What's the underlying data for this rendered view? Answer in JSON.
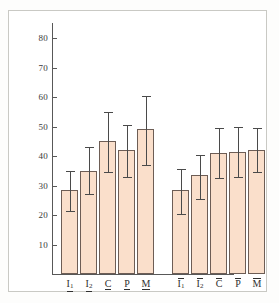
{
  "chart_data": {
    "type": "bar",
    "title": "",
    "subtitle": "",
    "xlabel": "",
    "ylabel": "",
    "ylim": [
      0,
      80
    ],
    "yticks": [
      10,
      20,
      30,
      40,
      50,
      60,
      70,
      80
    ],
    "grid": false,
    "legend": "none",
    "error_bars": "vertical, capped, symmetric-ish",
    "bar_color": "#fadfcb",
    "bar_edge_color": "#6d5d55",
    "error_bar_color": "#4a4a4a",
    "axis_color": "#585858",
    "frame_color": "#c9c9c4",
    "categories": [
      "I1",
      "I2",
      "C",
      "P",
      "M",
      "I1bar",
      "I2bar",
      "Cbar",
      "Pbar",
      "Mbar"
    ],
    "groups": [
      {
        "name": "underlined",
        "decoration": "underline",
        "categories": [
          "I1",
          "I2",
          "C",
          "P",
          "M"
        ]
      },
      {
        "name": "overlined",
        "decoration": "overline",
        "categories": [
          "I1",
          "I2",
          "C",
          "P",
          "M"
        ]
      }
    ],
    "values": [
      28.5,
      35.0,
      45.0,
      42.0,
      49.0,
      28.5,
      33.5,
      41.0,
      41.5,
      42.0
    ],
    "err_low": [
      21.5,
      27.0,
      34.5,
      33.0,
      37.0,
      20.5,
      25.5,
      32.5,
      33.0,
      34.5
    ],
    "err_high": [
      35.0,
      43.0,
      55.0,
      50.5,
      60.5,
      35.5,
      40.5,
      49.5,
      50.0,
      49.5
    ],
    "bars": [
      {
        "label": "I1",
        "label_glyph": "I",
        "label_sub": "1",
        "decoration": "underline",
        "value": 28.5,
        "low": 21.5,
        "high": 35.0
      },
      {
        "label": "I2",
        "label_glyph": "I",
        "label_sub": "2",
        "decoration": "underline",
        "value": 35.0,
        "low": 27.0,
        "high": 43.0
      },
      {
        "label": "C",
        "label_glyph": "C",
        "label_sub": "",
        "decoration": "underline",
        "value": 45.0,
        "low": 34.5,
        "high": 55.0
      },
      {
        "label": "P",
        "label_glyph": "P",
        "label_sub": "",
        "decoration": "underline",
        "value": 42.0,
        "low": 33.0,
        "high": 50.5
      },
      {
        "label": "M",
        "label_glyph": "M",
        "label_sub": "",
        "decoration": "underline",
        "value": 49.0,
        "low": 37.0,
        "high": 60.5
      },
      {
        "label": "I1bar",
        "label_glyph": "I",
        "label_sub": "1",
        "decoration": "overline",
        "value": 28.5,
        "low": 20.5,
        "high": 35.5
      },
      {
        "label": "I2bar",
        "label_glyph": "I",
        "label_sub": "2",
        "decoration": "overline",
        "value": 33.5,
        "low": 25.5,
        "high": 40.5
      },
      {
        "label": "Cbar",
        "label_glyph": "C",
        "label_sub": "",
        "decoration": "overline",
        "value": 41.0,
        "low": 32.5,
        "high": 49.5
      },
      {
        "label": "Pbar",
        "label_glyph": "P",
        "label_sub": "",
        "decoration": "overline",
        "value": 41.5,
        "low": 33.0,
        "high": 50.0
      },
      {
        "label": "Mbar",
        "label_glyph": "M",
        "label_sub": "",
        "decoration": "overline",
        "value": 42.0,
        "low": 34.5,
        "high": 49.5
      }
    ]
  },
  "axis": {
    "ytick_labels": [
      "80",
      "70",
      "60",
      "50",
      "40",
      "30",
      "20",
      "10"
    ]
  }
}
